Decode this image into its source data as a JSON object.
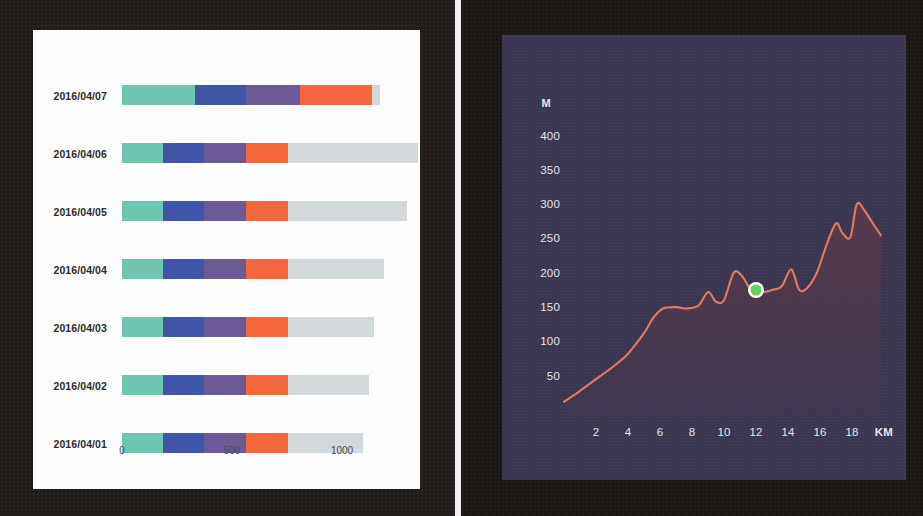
{
  "left_panel": {
    "name": "stacked-bar-chart-card",
    "axis": {
      "ticks": [
        {
          "label": "0",
          "value": 0
        },
        {
          "label": "500",
          "value": 500
        },
        {
          "label": "1000",
          "value": 1000
        }
      ],
      "max": 1350
    },
    "categories": [
      "2016/04/07",
      "2016/04/06",
      "2016/04/05",
      "2016/04/04",
      "2016/04/03",
      "2016/04/02",
      "2016/04/01"
    ]
  },
  "right_panel": {
    "name": "elevation-profile-card",
    "y_unit": "M",
    "y_ticks": [
      "400",
      "350",
      "300",
      "250",
      "200",
      "150",
      "100",
      "50"
    ],
    "x_ticks": [
      "2",
      "4",
      "6",
      "8",
      "10",
      "12",
      "14",
      "16",
      "18"
    ],
    "x_unit": "KM",
    "marker": {
      "km": 12,
      "m": 175
    }
  },
  "colors": {
    "teal": "#6ec6b0",
    "blue": "#4055a8",
    "purple": "#6b5a96",
    "orange": "#f4663c",
    "gray": "#d3d9da",
    "card_bg": "#fdfdfd",
    "panel_bg": "#211d1b",
    "elev_bg": "#3b3750",
    "elev_line": "#e07a5f",
    "elev_fill": "#5c3a4a",
    "marker_fill": "#5fd35f",
    "marker_ring": "#fdfdfd",
    "tick_text": "#4a4a4a",
    "label_text": "#2c2c2c",
    "elev_text": "#e6e3ec"
  },
  "chart_data": [
    {
      "type": "bar",
      "orientation": "horizontal",
      "stacked": true,
      "title": "",
      "xlabel": "",
      "ylabel": "",
      "xlim": [
        0,
        1350
      ],
      "grid": false,
      "legend": "none",
      "xticks": [
        0,
        500,
        1000
      ],
      "categories": [
        "2016/04/07",
        "2016/04/06",
        "2016/04/05",
        "2016/04/04",
        "2016/04/03",
        "2016/04/02",
        "2016/04/01"
      ],
      "series": [
        {
          "name": "teal",
          "color": "#6ec6b0",
          "values": [
            330,
            185,
            185,
            185,
            185,
            185,
            185
          ]
        },
        {
          "name": "blue",
          "color": "#4055a8",
          "values": [
            235,
            190,
            190,
            190,
            190,
            190,
            190
          ]
        },
        {
          "name": "purple",
          "color": "#6b5a96",
          "values": [
            245,
            190,
            190,
            190,
            190,
            190,
            190
          ]
        },
        {
          "name": "orange",
          "color": "#f4663c",
          "values": [
            325,
            190,
            190,
            190,
            190,
            190,
            190
          ]
        },
        {
          "name": "gray",
          "color": "#d3d9da",
          "values": [
            40,
            590,
            540,
            435,
            390,
            370,
            340
          ]
        }
      ],
      "totals": [
        1175,
        1345,
        1295,
        1190,
        1145,
        1125,
        1095
      ]
    },
    {
      "type": "area",
      "title": "",
      "xlabel": "KM",
      "ylabel": "M",
      "xlim": [
        0,
        20
      ],
      "ylim": [
        0,
        430
      ],
      "grid": false,
      "legend": "none",
      "yticks": [
        50,
        100,
        150,
        200,
        250,
        300,
        350,
        400
      ],
      "xticks": [
        2,
        4,
        6,
        8,
        10,
        12,
        14,
        16,
        18
      ],
      "x": [
        0,
        1,
        2,
        3,
        4,
        5,
        5.6,
        6.2,
        7,
        7.6,
        8.4,
        9,
        9.5,
        10,
        10.6,
        11.1,
        11.6,
        12,
        12.5,
        13,
        13.6,
        14.2,
        14.7,
        15.2,
        15.8,
        16.4,
        17,
        17.4,
        17.9,
        18.3,
        18.8,
        19.3,
        19.8
      ],
      "y": [
        12,
        28,
        45,
        62,
        82,
        112,
        135,
        148,
        150,
        148,
        152,
        172,
        158,
        160,
        200,
        196,
        178,
        175,
        172,
        175,
        180,
        205,
        175,
        178,
        200,
        240,
        272,
        258,
        252,
        300,
        290,
        272,
        255
      ],
      "marker": {
        "x": 12,
        "y": 175,
        "color": "#5fd35f"
      }
    }
  ]
}
